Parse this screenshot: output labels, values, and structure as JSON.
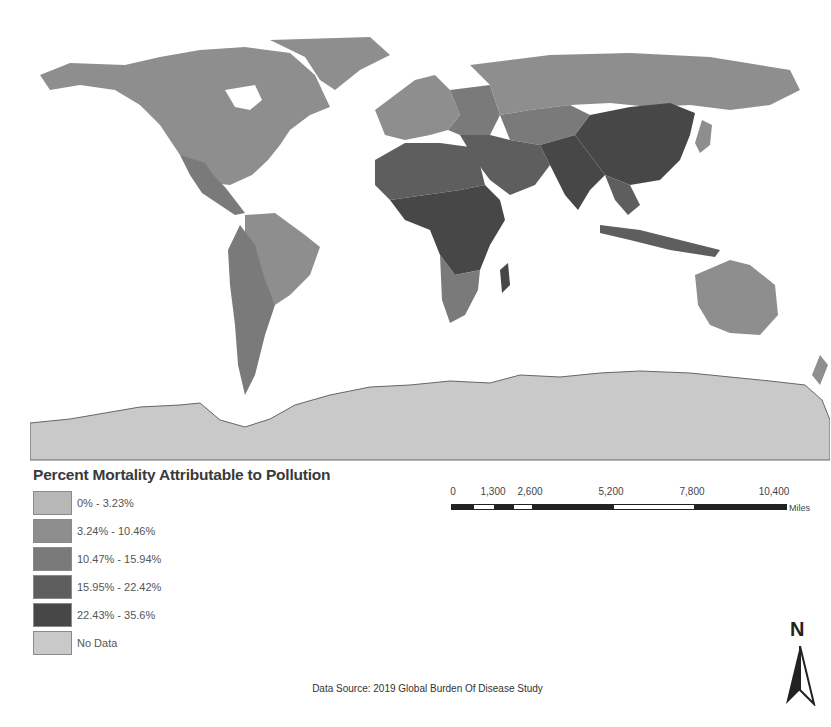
{
  "map": {
    "title": "Percent Mortality Attributable to Pollution",
    "projection": "world",
    "ocean_color": "#ffffff",
    "class_colors": {
      "c1": "#b7b7b7",
      "c2": "#8e8e8e",
      "c3": "#7a7a7a",
      "c4": "#5e5e5e",
      "c5": "#474747",
      "nodata": "#c9c9c9"
    },
    "regions": [
      {
        "name": "North America",
        "class": "c2"
      },
      {
        "name": "Greenland",
        "class": "c2"
      },
      {
        "name": "Central America",
        "class": "c3"
      },
      {
        "name": "South America (Brazil)",
        "class": "c2"
      },
      {
        "name": "South America (Andes)",
        "class": "c3"
      },
      {
        "name": "Western Europe",
        "class": "c2"
      },
      {
        "name": "Eastern Europe",
        "class": "c3"
      },
      {
        "name": "Russia",
        "class": "c2"
      },
      {
        "name": "Central Asia",
        "class": "c3"
      },
      {
        "name": "North Africa",
        "class": "c4"
      },
      {
        "name": "Sub-Saharan Africa",
        "class": "c5"
      },
      {
        "name": "Southern Africa",
        "class": "c3"
      },
      {
        "name": "Middle East",
        "class": "c4"
      },
      {
        "name": "South Asia",
        "class": "c5"
      },
      {
        "name": "China",
        "class": "c5"
      },
      {
        "name": "Southeast Asia",
        "class": "c4"
      },
      {
        "name": "Australia",
        "class": "c2"
      },
      {
        "name": "New Zealand",
        "class": "c2"
      },
      {
        "name": "Antarctica",
        "class": "nodata"
      }
    ]
  },
  "legend": {
    "title": "Percent Mortality Attributable to Pollution",
    "items": [
      {
        "label": "0% - 3.23%",
        "color": "#b7b7b7"
      },
      {
        "label": "3.24% - 10.46%",
        "color": "#8e8e8e"
      },
      {
        "label": "10.47% - 15.94%",
        "color": "#7a7a7a"
      },
      {
        "label": "15.95% - 22.42%",
        "color": "#5e5e5e"
      },
      {
        "label": "22.43% - 35.6%",
        "color": "#474747"
      },
      {
        "label": "No Data",
        "color": "#c9c9c9"
      }
    ]
  },
  "scale": {
    "ticks": [
      "0",
      "1,300",
      "2,600",
      "5,200",
      "7,800",
      "10,400"
    ],
    "unit": "Miles"
  },
  "north_arrow": {
    "label": "N"
  },
  "source": "Data Source: 2019 Global Burden Of Disease Study"
}
